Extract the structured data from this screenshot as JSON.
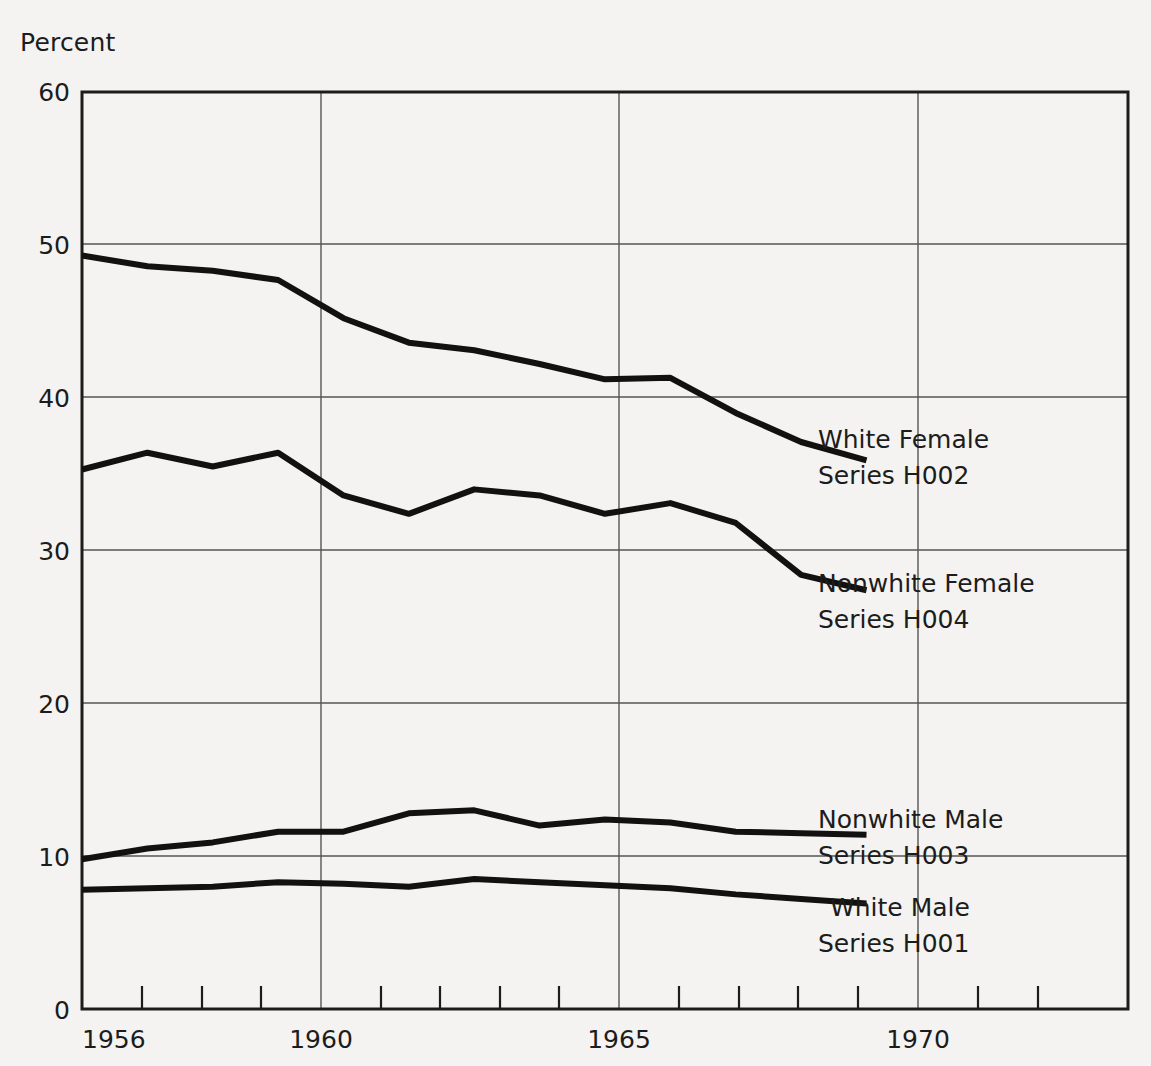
{
  "chart_data": {
    "type": "line",
    "title": "",
    "subtitle": "",
    "ylabel": "Percent",
    "xlabel": "",
    "ylim": [
      0,
      60
    ],
    "xlim": [
      1956,
      1972
    ],
    "grid": true,
    "legend_position": "inline-right-of-line-ends",
    "y_ticks": [
      0,
      10,
      20,
      30,
      40,
      50,
      60
    ],
    "y_tick_labels": [
      "0",
      "10",
      "20",
      "30",
      "40",
      "50",
      "60"
    ],
    "x_ticks": [
      1956,
      1957,
      1958,
      1959,
      1960,
      1961,
      1962,
      1963,
      1964,
      1965,
      1966,
      1967,
      1968,
      1969,
      1970,
      1971,
      1972
    ],
    "x_tick_labels_shown": [
      "1956",
      "1960",
      "1965",
      "1970"
    ],
    "x_major_ticks": [
      1956,
      1960,
      1965,
      1970
    ],
    "x": [
      1956,
      1957,
      1958,
      1959,
      1960,
      1961,
      1962,
      1963,
      1964,
      1965,
      1966,
      1967,
      1968
    ],
    "series": [
      {
        "name": "White Female",
        "code": "Series H002",
        "label_line1": "White Female",
        "label_line2": "Series H002",
        "values": [
          49.3,
          48.6,
          48.3,
          47.7,
          45.2,
          43.6,
          43.1,
          42.2,
          41.2,
          41.3,
          39.0,
          37.1,
          35.9
        ]
      },
      {
        "name": "Nonwhite Female",
        "code": "Series H004",
        "label_line1": "Nonwhite Female",
        "label_line2": "Series H004",
        "values": [
          35.3,
          36.4,
          35.5,
          36.4,
          33.6,
          32.4,
          34.0,
          33.6,
          32.4,
          33.1,
          31.8,
          28.4,
          27.4
        ]
      },
      {
        "name": "Nonwhite Male",
        "code": "Series H003",
        "label_line1": "Nonwhite Male",
        "label_line2": "Series H003",
        "values": [
          9.8,
          10.5,
          10.9,
          11.6,
          11.6,
          12.8,
          13.0,
          12.0,
          12.4,
          12.2,
          11.6,
          11.5,
          11.4
        ]
      },
      {
        "name": "White Male",
        "code": "Series H001",
        "label_line1": "White Male",
        "label_line2": "Series H001",
        "values": [
          7.8,
          7.9,
          8.0,
          8.3,
          8.2,
          8.0,
          8.5,
          8.3,
          8.1,
          7.9,
          7.5,
          7.2,
          6.9
        ]
      }
    ],
    "colors": {
      "line": "#111111",
      "grid": "#555555",
      "frame": "#1c1c1c",
      "background": "#f4f3f1",
      "text": "#1c1c1c"
    }
  },
  "labels": {
    "y_axis_title": "Percent",
    "y0": "0",
    "y10": "10",
    "y20": "20",
    "y30": "30",
    "y40": "40",
    "y50": "50",
    "y60": "60",
    "x1956": "1956",
    "x1960": "1960",
    "x1965": "1965",
    "x1970": "1970"
  },
  "annotations": {
    "white_female_l1": "White Female",
    "white_female_l2": "Series H002",
    "nonwhite_female_l1": "Nonwhite Female",
    "nonwhite_female_l2": "Series H004",
    "nonwhite_male_l1": "Nonwhite Male",
    "nonwhite_male_l2": "Series H003",
    "white_male_l1": "White Male",
    "white_male_l2": "Series H001"
  }
}
